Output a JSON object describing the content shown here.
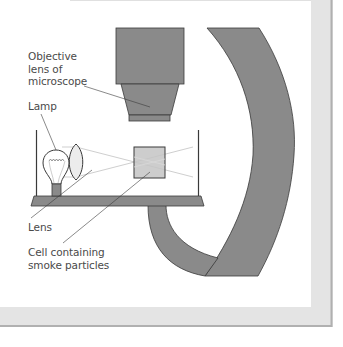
{
  "diagram": {
    "colors": {
      "part_fill": "#8a8a8a",
      "part_stroke": "#3a3a3a",
      "cell_fill": "#c4c4c4",
      "lens_fill": "#e6e6e6",
      "ray": "#cfcfcf",
      "label_text": "#4a4a4a",
      "border_fill": "#e4e4e4",
      "border_edge": "#b0b0b0"
    },
    "labels": {
      "objective": {
        "lines": [
          "Objective",
          "lens of",
          "microscope"
        ]
      },
      "lamp": {
        "lines": [
          "Lamp"
        ]
      },
      "lens": {
        "lines": [
          "Lens"
        ]
      },
      "cell": {
        "lines": [
          "Cell containing",
          "smoke particles"
        ]
      }
    }
  }
}
